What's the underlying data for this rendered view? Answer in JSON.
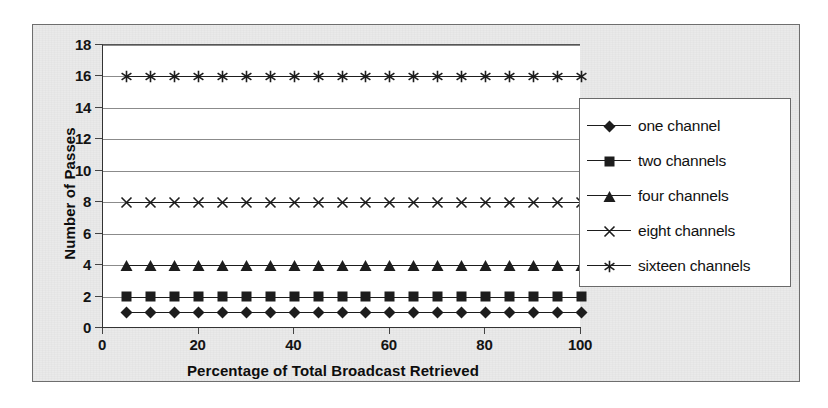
{
  "chart_data": {
    "type": "line",
    "title": "",
    "xlabel": "Percentage of Total Broadcast Retrieved",
    "ylabel": "Number of Passes",
    "xlim": [
      0,
      100
    ],
    "ylim": [
      0,
      18
    ],
    "xticks": [
      0,
      20,
      40,
      60,
      80,
      100
    ],
    "yticks": [
      0,
      2,
      4,
      6,
      8,
      10,
      12,
      14,
      16,
      18
    ],
    "grid": "horizontal",
    "legend_position": "right",
    "x": [
      5,
      10,
      15,
      20,
      25,
      30,
      35,
      40,
      45,
      50,
      55,
      60,
      65,
      70,
      75,
      80,
      85,
      90,
      95,
      100
    ],
    "series": [
      {
        "name": "one channel",
        "marker": "diamond",
        "color": "#1d1d1d",
        "values": [
          1,
          1,
          1,
          1,
          1,
          1,
          1,
          1,
          1,
          1,
          1,
          1,
          1,
          1,
          1,
          1,
          1,
          1,
          1,
          1
        ]
      },
      {
        "name": "two channels",
        "marker": "square",
        "color": "#1d1d1d",
        "values": [
          2,
          2,
          2,
          2,
          2,
          2,
          2,
          2,
          2,
          2,
          2,
          2,
          2,
          2,
          2,
          2,
          2,
          2,
          2,
          2
        ]
      },
      {
        "name": "four channels",
        "marker": "triangle",
        "color": "#1d1d1d",
        "values": [
          4,
          4,
          4,
          4,
          4,
          4,
          4,
          4,
          4,
          4,
          4,
          4,
          4,
          4,
          4,
          4,
          4,
          4,
          4,
          4
        ]
      },
      {
        "name": "eight channels",
        "marker": "cross-x",
        "color": "#1d1d1d",
        "values": [
          8,
          8,
          8,
          8,
          8,
          8,
          8,
          8,
          8,
          8,
          8,
          8,
          8,
          8,
          8,
          8,
          8,
          8,
          8,
          8
        ]
      },
      {
        "name": "sixteen channels",
        "marker": "asterisk",
        "color": "#1d1d1d",
        "values": [
          16,
          16,
          16,
          16,
          16,
          16,
          16,
          16,
          16,
          16,
          16,
          16,
          16,
          16,
          16,
          16,
          16,
          16,
          16,
          16
        ]
      }
    ]
  },
  "colors": {
    "card_background": "#e9e9e9",
    "plot_background": "#ffffff",
    "gridline": "#8b8b8b",
    "axis": "#333333",
    "text": "#111111"
  }
}
